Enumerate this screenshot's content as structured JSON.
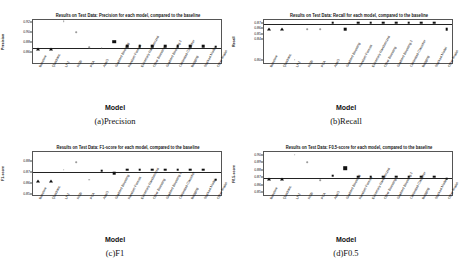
{
  "figure": {
    "xaxis_title": "Model",
    "model_labels": [
      "Baseline",
      "Quadratic",
      "LR2",
      "RGB",
      "PCA",
      "AdaG",
      "Gradient Boosting",
      "Random Forests",
      "Extremely Randomized",
      "Other Boosting",
      "Gradient Boosting 2",
      "Calibrated Classifier",
      "Bagging",
      "Stacked Model",
      "Other Model"
    ]
  },
  "chart_data": [
    {
      "id": "precision",
      "type": "scatter",
      "title": "Results on Test Data: Precision for each model, compared to the baseline",
      "xlabel": "Model",
      "ylabel": "Precision",
      "caption": "(a)Precision",
      "ylim": [
        0.835,
        0.925
      ],
      "yticks": [
        0.92,
        0.9,
        0.88,
        0.86
      ],
      "ytick_labels": [
        "0.92",
        "0.90",
        "0.88",
        "0.86"
      ],
      "baseline_value": 0.869,
      "categories": [
        "Baseline",
        "Quadratic",
        "LR2",
        "RGB",
        "PCA",
        "AdaG",
        "Gradient Boosting",
        "Random Forests",
        "Extremely Randomized",
        "Other Boosting",
        "Gradient Boosting 2",
        "Calibrated Classifier",
        "Bagging",
        "Stacked Model",
        "Other Model"
      ],
      "values": [
        0.866,
        0.866,
        0.921,
        0.899,
        0.869,
        0.868,
        0.88,
        0.871,
        0.871,
        0.871,
        0.871,
        0.871,
        0.871,
        0.871,
        0.87
      ],
      "marker_types": [
        "triangle",
        "triangle",
        "dot",
        "dot",
        "dot",
        "dot",
        "square-lg",
        "square",
        "square",
        "square",
        "square",
        "square",
        "square",
        "square",
        "square"
      ]
    },
    {
      "id": "recall",
      "type": "scatter",
      "title": "Results on Test Data: Recall for each model, compared to the baseline",
      "xlabel": "Model",
      "ylabel": "Recall",
      "caption": "(b)Recall",
      "ylim": [
        0.792,
        0.878
      ],
      "yticks": [
        0.87,
        0.86,
        0.85,
        0.84,
        0.8
      ],
      "ytick_labels": [
        "0.87",
        "0.86",
        "0.85",
        "0.84",
        "0.80"
      ],
      "baseline_value": 0.871,
      "categories": [
        "Baseline",
        "Quadratic",
        "LR2",
        "RGB",
        "PCA",
        "AdaG",
        "Gradient Boosting",
        "Random Forests",
        "Extremely Randomized",
        "Other Boosting",
        "Gradient Boosting 2",
        "Calibrated Classifier",
        "Bagging",
        "Stacked Model",
        "Other Model"
      ],
      "values": [
        0.859,
        0.859,
        0.8,
        0.858,
        0.858,
        0.871,
        0.859,
        0.871,
        0.871,
        0.871,
        0.871,
        0.871,
        0.871,
        0.871,
        0.859
      ],
      "marker_types": [
        "triangle",
        "triangle",
        "dot",
        "dot",
        "dot",
        "square",
        "square",
        "square",
        "square",
        "square",
        "square",
        "square",
        "square",
        "square",
        "square"
      ]
    },
    {
      "id": "f1",
      "type": "scatter",
      "title": "Results on Test Data: F1-score for each model, compared to the baseline",
      "xlabel": "Model",
      "ylabel": "F1-score",
      "caption": "(c)F1",
      "ylim": [
        0.848,
        0.889
      ],
      "yticks": [
        0.88,
        0.87,
        0.86,
        0.85
      ],
      "ytick_labels": [
        "0.88",
        "0.87",
        "0.86",
        "0.85"
      ],
      "baseline_value": 0.871,
      "categories": [
        "Baseline",
        "Quadratic",
        "LR2",
        "RGB",
        "PCA",
        "AdaG",
        "Gradient Boosting",
        "Random Forests",
        "Extremely Randomized",
        "Other Boosting",
        "Gradient Boosting 2",
        "Calibrated Classifier",
        "Bagging",
        "Stacked Model",
        "Other Model"
      ],
      "values": [
        0.862,
        0.862,
        0.872,
        0.879,
        0.863,
        0.871,
        0.869,
        0.872,
        0.872,
        0.872,
        0.872,
        0.872,
        0.872,
        0.872,
        0.863
      ],
      "marker_types": [
        "triangle",
        "triangle",
        "dot",
        "dot",
        "dot",
        "square",
        "square",
        "square",
        "square",
        "square",
        "square",
        "square",
        "square",
        "square",
        "square"
      ]
    },
    {
      "id": "f05",
      "type": "scatter",
      "title": "Results on Test Data: F0.5-score for each model, compared to the baseline",
      "xlabel": "Model",
      "ylabel": "F0.5-score",
      "caption": "(d)F0.5",
      "ylim": [
        0.845,
        0.905
      ],
      "yticks": [
        0.9,
        0.89,
        0.88,
        0.87,
        0.86,
        0.85
      ],
      "ytick_labels": [
        "0.90",
        "0.89",
        "0.88",
        "0.87",
        "0.86",
        "0.85"
      ],
      "baseline_value": 0.871,
      "categories": [
        "Baseline",
        "Quadratic",
        "LR2",
        "RGB",
        "PCA",
        "AdaG",
        "Gradient Boosting",
        "Random Forests",
        "Extremely Randomized",
        "Other Boosting",
        "Gradient Boosting 2",
        "Calibrated Classifier",
        "Bagging",
        "Stacked Model",
        "Other Model"
      ],
      "values": [
        0.868,
        0.868,
        0.9,
        0.89,
        0.866,
        0.872,
        0.882,
        0.871,
        0.871,
        0.871,
        0.871,
        0.871,
        0.871,
        0.871,
        0.868
      ],
      "marker_types": [
        "triangle",
        "triangle",
        "dot",
        "dot",
        "dot",
        "square",
        "square-lg",
        "square",
        "square",
        "square",
        "square",
        "square",
        "square",
        "square",
        "square"
      ]
    }
  ]
}
